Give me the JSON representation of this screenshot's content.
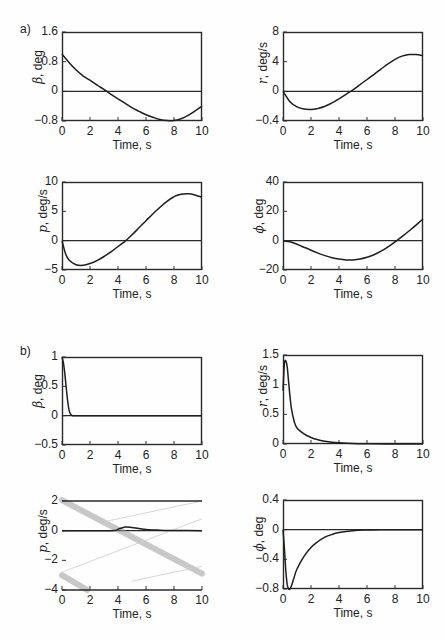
{
  "figure": {
    "panel_labels": [
      "a)",
      "b)"
    ]
  },
  "chart_data": [
    {
      "id": "a-beta",
      "panel": "a)",
      "type": "line",
      "title": "",
      "xlabel": "Time, s",
      "ylabel_symbol": "β",
      "ylabel_unit": ", deg",
      "xlim": [
        0,
        10
      ],
      "ylim": [
        -0.8,
        1.6
      ],
      "xticks": [
        "0",
        "2",
        "4",
        "6",
        "8",
        "10"
      ],
      "yticks": [
        "1.6",
        "0.8",
        "0",
        "−0.8"
      ],
      "ytick_values": [
        1.6,
        0.8,
        0,
        -0.8
      ],
      "zero_line": true,
      "grid": false,
      "x": [
        0,
        0.5,
        1,
        1.5,
        2,
        2.5,
        3,
        3.5,
        4,
        4.5,
        5,
        5.5,
        6,
        6.5,
        7,
        7.5,
        8,
        8.5,
        9,
        9.5,
        10
      ],
      "y": [
        1.0,
        0.78,
        0.58,
        0.42,
        0.3,
        0.17,
        0.05,
        -0.08,
        -0.2,
        -0.32,
        -0.44,
        -0.54,
        -0.63,
        -0.7,
        -0.76,
        -0.79,
        -0.79,
        -0.74,
        -0.65,
        -0.53,
        -0.4
      ]
    },
    {
      "id": "a-r",
      "panel": "a)",
      "type": "line",
      "title": "",
      "xlabel": "Time, s",
      "ylabel_symbol": "r",
      "ylabel_unit": ", deg/s",
      "xlim": [
        0,
        10
      ],
      "ylim": [
        -4,
        8
      ],
      "xticks": [
        "0",
        "2",
        "4",
        "6",
        "8",
        "10"
      ],
      "yticks": [
        "8",
        "4",
        "0",
        "−0.4"
      ],
      "ytick_values": [
        8,
        4,
        0,
        -4
      ],
      "zero_line": true,
      "grid": false,
      "x": [
        0,
        0.5,
        1,
        1.5,
        2,
        2.5,
        3,
        3.5,
        4,
        4.5,
        5,
        5.5,
        6,
        6.5,
        7,
        7.5,
        8,
        8.5,
        9,
        9.5,
        10
      ],
      "y": [
        0,
        -1.4,
        -2.1,
        -2.4,
        -2.45,
        -2.3,
        -2.0,
        -1.55,
        -1.0,
        -0.4,
        0.2,
        0.9,
        1.6,
        2.3,
        3.0,
        3.7,
        4.3,
        4.75,
        4.95,
        4.95,
        4.8
      ]
    },
    {
      "id": "a-p",
      "panel": "a)",
      "type": "line",
      "title": "",
      "xlabel": "Time, s",
      "ylabel_symbol": "p",
      "ylabel_unit": ", deg/s",
      "xlim": [
        0,
        10
      ],
      "ylim": [
        -5,
        10
      ],
      "xticks": [
        "0",
        "2",
        "4",
        "6",
        "8",
        "10"
      ],
      "yticks": [
        "10",
        "5",
        "0",
        "−5"
      ],
      "ytick_values": [
        10,
        5,
        0,
        -5
      ],
      "zero_line": true,
      "grid": false,
      "x": [
        0,
        0.25,
        0.5,
        1,
        1.5,
        2,
        2.5,
        3,
        3.5,
        4,
        4.5,
        5,
        5.5,
        6,
        6.5,
        7,
        7.5,
        8,
        8.5,
        9,
        9.5,
        10
      ],
      "y": [
        0,
        -2.2,
        -3.3,
        -4.1,
        -4.2,
        -3.9,
        -3.4,
        -2.7,
        -1.9,
        -1.0,
        -0.1,
        1.0,
        2.2,
        3.4,
        4.6,
        5.7,
        6.7,
        7.5,
        7.9,
        8.0,
        7.8,
        7.4
      ]
    },
    {
      "id": "a-phi",
      "panel": "a)",
      "type": "line",
      "title": "",
      "xlabel": "Time, s",
      "ylabel_symbol": "ϕ",
      "ylabel_unit": ", deg",
      "xlim": [
        0,
        10
      ],
      "ylim": [
        -20,
        40
      ],
      "xticks": [
        "0",
        "2",
        "4",
        "6",
        "8",
        "10"
      ],
      "yticks": [
        "40",
        "20",
        "0",
        "−20"
      ],
      "ytick_values": [
        40,
        20,
        0,
        -20
      ],
      "zero_line": true,
      "grid": false,
      "x": [
        0,
        0.5,
        1,
        1.5,
        2,
        2.5,
        3,
        3.5,
        4,
        4.5,
        5,
        5.5,
        6,
        6.5,
        7,
        7.5,
        8,
        8.5,
        9,
        9.5,
        10
      ],
      "y": [
        0,
        -0.8,
        -2.5,
        -4.5,
        -6.5,
        -8.5,
        -10.2,
        -11.6,
        -12.6,
        -13.1,
        -13.1,
        -12.5,
        -11.3,
        -9.6,
        -7.2,
        -4.2,
        -0.8,
        2.8,
        6.6,
        10.6,
        14.8
      ]
    },
    {
      "id": "b-beta",
      "panel": "b)",
      "type": "line",
      "title": "",
      "xlabel": "Time, s",
      "ylabel_symbol": "β",
      "ylabel_unit": ", deg",
      "xlim": [
        0,
        10
      ],
      "ylim": [
        -0.5,
        1
      ],
      "xticks": [
        "0",
        "2",
        "4",
        "6",
        "8",
        "10"
      ],
      "yticks": [
        "1",
        "0.5",
        "0",
        "−0.5"
      ],
      "ytick_values": [
        1,
        0.5,
        0,
        -0.5
      ],
      "zero_line": true,
      "grid": false,
      "x": [
        0,
        0.1,
        0.2,
        0.3,
        0.4,
        0.5,
        0.6,
        0.7,
        0.8,
        1,
        2,
        4,
        6,
        8,
        10
      ],
      "y": [
        1.0,
        0.9,
        0.72,
        0.48,
        0.26,
        0.1,
        0.03,
        0.005,
        0,
        0,
        0,
        0,
        0,
        0,
        0
      ]
    },
    {
      "id": "b-r",
      "panel": "b)",
      "type": "line",
      "title": "",
      "xlabel": "Time, s",
      "ylabel_symbol": "r",
      "ylabel_unit": ", deg/s",
      "xlim": [
        0,
        10
      ],
      "ylim": [
        0,
        1.5
      ],
      "xticks": [
        "0",
        "2",
        "4",
        "6",
        "8",
        "10"
      ],
      "yticks": [
        "1.5",
        "1",
        "0.5",
        "0"
      ],
      "ytick_values": [
        1.5,
        1,
        0.5,
        0
      ],
      "zero_line": false,
      "grid": false,
      "x": [
        0,
        0.1,
        0.2,
        0.3,
        0.4,
        0.5,
        0.6,
        0.8,
        1,
        1.5,
        2,
        2.5,
        3,
        3.5,
        4,
        5,
        6,
        8,
        10
      ],
      "y": [
        0.9,
        1.35,
        1.4,
        1.3,
        1.05,
        0.8,
        0.6,
        0.38,
        0.27,
        0.17,
        0.11,
        0.07,
        0.045,
        0.03,
        0.02,
        0.01,
        0.005,
        0,
        0
      ]
    },
    {
      "id": "b-p",
      "panel": "b)",
      "type": "line",
      "title": "",
      "xlabel": "Time, s",
      "ylabel_symbol": "p",
      "ylabel_unit": ", deg/s",
      "xlim": [
        0,
        10
      ],
      "ylim": [
        -4,
        2
      ],
      "xticks": [
        "0",
        "2",
        "4",
        "6",
        "8",
        "10"
      ],
      "yticks": [
        "2",
        "0",
        "−2",
        "−4"
      ],
      "ytick_values": [
        2,
        0,
        -2,
        -4
      ],
      "zero_line": true,
      "grid": false,
      "note": "Scan artifact: diagonal smeared bands overlap the plot",
      "x": [
        0,
        3.5,
        4,
        4.5,
        5,
        5.5,
        6,
        7,
        8,
        10
      ],
      "y": [
        0,
        0,
        0.1,
        0.25,
        0.22,
        0.15,
        0.08,
        0.03,
        0.01,
        0
      ]
    },
    {
      "id": "b-phi",
      "panel": "b)",
      "type": "line",
      "title": "",
      "xlabel": "Time, s",
      "ylabel_symbol": "ϕ",
      "ylabel_unit": ", deg",
      "xlim": [
        0,
        10
      ],
      "ylim": [
        -0.8,
        0.4
      ],
      "xticks": [
        "0",
        "2",
        "4",
        "6",
        "8",
        "10"
      ],
      "yticks": [
        "0.4",
        "0",
        "−0.4",
        "−0.8"
      ],
      "ytick_values": [
        0.4,
        0,
        -0.4,
        -0.8
      ],
      "zero_line": true,
      "grid": false,
      "x": [
        0,
        0.1,
        0.2,
        0.3,
        0.4,
        0.5,
        0.6,
        0.8,
        1,
        1.5,
        2,
        2.5,
        3,
        3.5,
        4,
        5,
        6,
        7,
        8,
        10
      ],
      "y": [
        0,
        -0.25,
        -0.55,
        -0.74,
        -0.8,
        -0.8,
        -0.76,
        -0.64,
        -0.53,
        -0.36,
        -0.24,
        -0.16,
        -0.1,
        -0.065,
        -0.04,
        -0.015,
        -0.005,
        0,
        0,
        0
      ]
    }
  ]
}
